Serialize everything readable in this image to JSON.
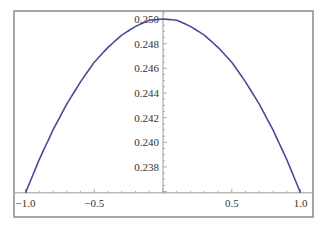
{
  "chart_data": {
    "type": "line",
    "title": "",
    "xlabel": "",
    "ylabel": "",
    "xlim": [
      -1.0,
      1.0
    ],
    "ylim": [
      0.2359,
      0.2505
    ],
    "grid": false,
    "legend": null,
    "x_ticks": [
      "-1.0",
      "-0.5",
      "0.5",
      "1.0"
    ],
    "x_tick_values": [
      -1.0,
      -0.5,
      0.5,
      1.0
    ],
    "y_ticks": [
      "0.238",
      "0.240",
      "0.242",
      "0.244",
      "0.246",
      "0.248",
      "0.250"
    ],
    "y_tick_values": [
      0.238,
      0.24,
      0.242,
      0.244,
      0.246,
      0.248,
      0.25
    ],
    "series": [
      {
        "name": "curve",
        "color": "#4a4a9a",
        "x": [
          -1.0,
          -0.9,
          -0.8,
          -0.7,
          -0.6,
          -0.5,
          -0.4,
          -0.3,
          -0.2,
          -0.1,
          0.0,
          0.1,
          0.2,
          0.3,
          0.4,
          0.5,
          0.6,
          0.7,
          0.8,
          0.9,
          1.0
        ],
        "y": [
          0.2359,
          0.2386,
          0.241,
          0.2431,
          0.2449,
          0.2465,
          0.2477,
          0.2487,
          0.2494,
          0.2499,
          0.25,
          0.2499,
          0.2494,
          0.2487,
          0.2477,
          0.2465,
          0.2449,
          0.2431,
          0.241,
          0.2386,
          0.2359
        ]
      }
    ]
  },
  "colors": {
    "frame": "#8a8a8a",
    "axis": "#999999",
    "curve": "#4a4a9a"
  }
}
